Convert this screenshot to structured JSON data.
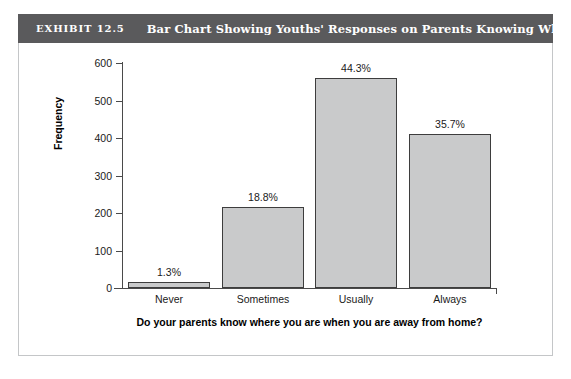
{
  "exhibit": {
    "number": "EXHIBIT 12.5",
    "title": "Bar Chart Showing Youths' Responses on Parents Knowing Where They Are",
    "header_bg": "#5a5a5c",
    "header_text_color": "#ffffff",
    "frame_border_color": "#c4c6c8"
  },
  "chart_data": {
    "type": "bar",
    "title": "Bar Chart Showing Youths' Responses on Parents Knowing Where They Are",
    "categories": [
      "Never",
      "Sometimes",
      "Usually",
      "Always"
    ],
    "values": [
      15,
      216,
      560,
      412
    ],
    "data_labels": [
      "1.3%",
      "18.8%",
      "44.3%",
      "35.7%"
    ],
    "percentages": [
      1.3,
      18.8,
      44.3,
      35.7
    ],
    "xlabel": "Do your parents know where you are when you are away from home?",
    "ylabel": "Frequency",
    "ylim": [
      0,
      600
    ],
    "yticks": [
      0,
      100,
      200,
      300,
      400,
      500,
      600
    ],
    "ytick_labels": [
      "0",
      "100",
      "200",
      "300",
      "400",
      "500",
      "600"
    ],
    "grid": false,
    "legend": false,
    "bar_fill_color": "#c9cacb",
    "bar_border_color": "#3d3d3d",
    "axis_color": "#4a4a4a"
  }
}
